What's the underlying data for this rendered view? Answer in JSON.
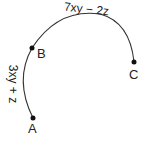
{
  "diagram": {
    "points": [
      {
        "name": "A",
        "x": 33,
        "y": 118
      },
      {
        "name": "B",
        "x": 32,
        "y": 48
      },
      {
        "name": "C",
        "x": 134,
        "y": 62
      }
    ],
    "arcs": [
      {
        "from": "A",
        "to": "B",
        "label": "3xy + z"
      },
      {
        "from": "B",
        "to": "C",
        "label": "7xy − 2z"
      }
    ],
    "stroke_color": "#333333"
  }
}
